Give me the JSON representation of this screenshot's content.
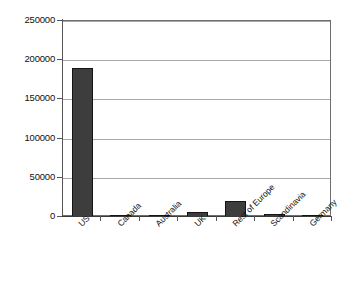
{
  "chart_data": {
    "type": "bar",
    "title": "",
    "subtitle": "",
    "xlabel": "",
    "ylabel": "",
    "categories": [
      "US",
      "Canada",
      "Australia",
      "UK",
      "Rest of Europe",
      "Scandinavia",
      "Germany"
    ],
    "values": [
      190000,
      3000,
      2000,
      7000,
      21000,
      4000,
      2500
    ],
    "ylim": [
      0,
      250000
    ],
    "ytick_labels": [
      "0",
      "50000",
      "100000",
      "150000",
      "200000",
      "250000"
    ],
    "ytick_values": [
      0,
      50000,
      100000,
      150000,
      200000,
      250000
    ],
    "grid": true,
    "legend": false,
    "legend_position": "none",
    "bar_color": "#3d3d3d",
    "bar_edge_color": "#141414",
    "gridline_color": "#a8a8a8",
    "axis_color": "#555555",
    "plot_background": "#ffffff",
    "xtick_label_rotation": -45
  }
}
